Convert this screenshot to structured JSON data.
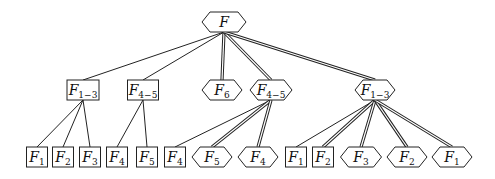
{
  "diagram": {
    "type": "tree",
    "nodes": [
      {
        "id": "root",
        "shape": "hexagon",
        "base": "F",
        "sub": "",
        "x": 224,
        "y": 22,
        "w": 44
      },
      {
        "id": "n1",
        "shape": "box",
        "base": "F",
        "sub": "1−3",
        "x": 83,
        "y": 90,
        "w": 32
      },
      {
        "id": "n2",
        "shape": "box",
        "base": "F",
        "sub": "4−5",
        "x": 143,
        "y": 90,
        "w": 31
      },
      {
        "id": "n3",
        "shape": "hexagon",
        "base": "F",
        "sub": "6",
        "x": 222,
        "y": 90,
        "w": 40
      },
      {
        "id": "n4",
        "shape": "hexagon",
        "base": "F",
        "sub": "4−5",
        "x": 271,
        "y": 90,
        "w": 42
      },
      {
        "id": "n5",
        "shape": "hexagon",
        "base": "F",
        "sub": "1−3",
        "x": 375,
        "y": 90,
        "w": 40
      },
      {
        "id": "l1",
        "shape": "box",
        "base": "F",
        "sub": "1",
        "x": 37,
        "y": 157,
        "w": 21
      },
      {
        "id": "l2",
        "shape": "box",
        "base": "F",
        "sub": "2",
        "x": 63,
        "y": 157,
        "w": 21
      },
      {
        "id": "l3",
        "shape": "box",
        "base": "F",
        "sub": "3",
        "x": 90,
        "y": 157,
        "w": 21
      },
      {
        "id": "l4",
        "shape": "box",
        "base": "F",
        "sub": "4",
        "x": 117,
        "y": 157,
        "w": 21
      },
      {
        "id": "l5",
        "shape": "box",
        "base": "F",
        "sub": "5",
        "x": 147,
        "y": 157,
        "w": 21
      },
      {
        "id": "l6",
        "shape": "box",
        "base": "F",
        "sub": "4",
        "x": 175,
        "y": 157,
        "w": 21
      },
      {
        "id": "l7",
        "shape": "hexagon",
        "base": "F",
        "sub": "5",
        "x": 212,
        "y": 157,
        "w": 40
      },
      {
        "id": "l8",
        "shape": "hexagon",
        "base": "F",
        "sub": "4",
        "x": 258,
        "y": 157,
        "w": 40
      },
      {
        "id": "l9",
        "shape": "box",
        "base": "F",
        "sub": "1",
        "x": 296,
        "y": 157,
        "w": 21
      },
      {
        "id": "l10",
        "shape": "box",
        "base": "F",
        "sub": "2",
        "x": 323,
        "y": 157,
        "w": 21
      },
      {
        "id": "l11",
        "shape": "hexagon",
        "base": "F",
        "sub": "3",
        "x": 361,
        "y": 157,
        "w": 41
      },
      {
        "id": "l12",
        "shape": "hexagon",
        "base": "F",
        "sub": "2",
        "x": 407,
        "y": 157,
        "w": 40
      },
      {
        "id": "l13",
        "shape": "hexagon",
        "base": "F",
        "sub": "1",
        "x": 452,
        "y": 157,
        "w": 40
      }
    ],
    "edges": [
      {
        "from": "root",
        "to": "n1",
        "style": "single"
      },
      {
        "from": "root",
        "to": "n2",
        "style": "single"
      },
      {
        "from": "root",
        "to": "n3",
        "style": "double"
      },
      {
        "from": "root",
        "to": "n4",
        "style": "double"
      },
      {
        "from": "root",
        "to": "n5",
        "style": "double"
      },
      {
        "from": "n1",
        "to": "l1",
        "style": "single"
      },
      {
        "from": "n1",
        "to": "l2",
        "style": "single"
      },
      {
        "from": "n1",
        "to": "l3",
        "style": "single"
      },
      {
        "from": "n2",
        "to": "l4",
        "style": "single"
      },
      {
        "from": "n2",
        "to": "l5",
        "style": "single"
      },
      {
        "from": "n4",
        "to": "l6",
        "style": "single"
      },
      {
        "from": "n4",
        "to": "l7",
        "style": "double"
      },
      {
        "from": "n4",
        "to": "l8",
        "style": "double"
      },
      {
        "from": "n5",
        "to": "l9",
        "style": "single"
      },
      {
        "from": "n5",
        "to": "l10",
        "style": "double"
      },
      {
        "from": "n5",
        "to": "l11",
        "style": "double"
      },
      {
        "from": "n5",
        "to": "l12",
        "style": "double"
      },
      {
        "from": "n5",
        "to": "l13",
        "style": "double"
      }
    ]
  }
}
